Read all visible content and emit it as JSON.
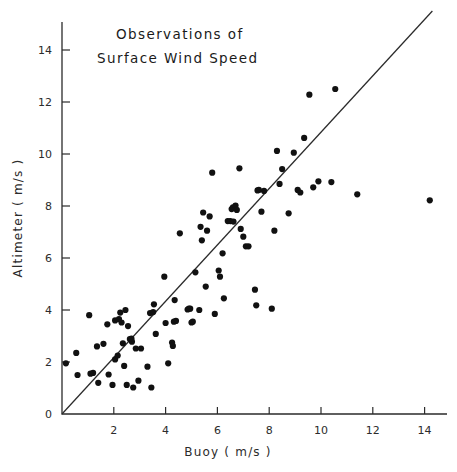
{
  "figure": {
    "title_line1": "Observations of",
    "title_line2": "Surface Wind Speed",
    "background": "#ffffff",
    "ink": "#1a1a1a"
  },
  "chart_data": {
    "type": "scatter",
    "title": "Observations of Surface Wind Speed",
    "xlabel": "Buoy  ( m/s )",
    "ylabel": "Altimeter  ( m/s )",
    "xlim": [
      0,
      15
    ],
    "ylim": [
      0,
      15
    ],
    "grid": false,
    "legend": null,
    "xticks": [
      0,
      2,
      4,
      6,
      8,
      10,
      12,
      14
    ],
    "yticks": [
      0,
      2,
      4,
      6,
      8,
      10,
      12,
      14
    ],
    "xtick_labels": [
      "0",
      "2",
      "4",
      "6",
      "8",
      "10",
      "12",
      "14"
    ],
    "ytick_labels": [
      "0",
      "2",
      "4",
      "6",
      "8",
      "10",
      "12",
      "14"
    ],
    "reference_line": {
      "label": "one-to-one line",
      "x": [
        0.0,
        14.3
      ],
      "y": [
        0.0,
        15.5
      ],
      "slope": 1.085,
      "intercept": 0.0
    },
    "marker": {
      "shape": "circle",
      "size_px": 3.1,
      "color": "#111111"
    },
    "points": [
      {
        "x": 0.15,
        "y": 1.95
      },
      {
        "x": 0.55,
        "y": 2.35
      },
      {
        "x": 0.6,
        "y": 1.5
      },
      {
        "x": 1.05,
        "y": 3.8
      },
      {
        "x": 1.2,
        "y": 1.58
      },
      {
        "x": 1.35,
        "y": 2.6
      },
      {
        "x": 1.4,
        "y": 1.2
      },
      {
        "x": 1.6,
        "y": 2.7
      },
      {
        "x": 1.75,
        "y": 3.45
      },
      {
        "x": 1.8,
        "y": 1.52
      },
      {
        "x": 1.95,
        "y": 1.12
      },
      {
        "x": 2.05,
        "y": 2.1
      },
      {
        "x": 2.15,
        "y": 2.25
      },
      {
        "x": 2.2,
        "y": 3.65
      },
      {
        "x": 2.25,
        "y": 3.9
      },
      {
        "x": 2.3,
        "y": 3.52
      },
      {
        "x": 2.35,
        "y": 2.72
      },
      {
        "x": 2.4,
        "y": 1.85
      },
      {
        "x": 2.45,
        "y": 4.0
      },
      {
        "x": 2.5,
        "y": 1.12
      },
      {
        "x": 2.55,
        "y": 3.38
      },
      {
        "x": 2.62,
        "y": 2.88
      },
      {
        "x": 2.7,
        "y": 2.78
      },
      {
        "x": 2.75,
        "y": 1.02
      },
      {
        "x": 2.85,
        "y": 2.52
      },
      {
        "x": 2.95,
        "y": 1.28
      },
      {
        "x": 3.3,
        "y": 1.82
      },
      {
        "x": 3.4,
        "y": 3.88
      },
      {
        "x": 3.45,
        "y": 1.02
      },
      {
        "x": 3.55,
        "y": 4.22
      },
      {
        "x": 3.62,
        "y": 3.08
      },
      {
        "x": 3.95,
        "y": 5.28
      },
      {
        "x": 4.0,
        "y": 3.5
      },
      {
        "x": 4.1,
        "y": 1.95
      },
      {
        "x": 4.25,
        "y": 2.75
      },
      {
        "x": 4.28,
        "y": 2.62
      },
      {
        "x": 4.32,
        "y": 3.55
      },
      {
        "x": 4.35,
        "y": 4.38
      },
      {
        "x": 4.4,
        "y": 3.58
      },
      {
        "x": 4.55,
        "y": 6.95
      },
      {
        "x": 4.85,
        "y": 4.02
      },
      {
        "x": 4.95,
        "y": 4.05
      },
      {
        "x": 5.0,
        "y": 3.52
      },
      {
        "x": 5.15,
        "y": 5.45
      },
      {
        "x": 5.3,
        "y": 4.0
      },
      {
        "x": 5.35,
        "y": 7.2
      },
      {
        "x": 5.4,
        "y": 6.68
      },
      {
        "x": 5.45,
        "y": 7.75
      },
      {
        "x": 5.55,
        "y": 4.9
      },
      {
        "x": 5.6,
        "y": 7.05
      },
      {
        "x": 5.7,
        "y": 7.6
      },
      {
        "x": 5.8,
        "y": 9.28
      },
      {
        "x": 5.9,
        "y": 3.85
      },
      {
        "x": 6.05,
        "y": 5.52
      },
      {
        "x": 6.1,
        "y": 5.28
      },
      {
        "x": 6.2,
        "y": 6.18
      },
      {
        "x": 6.25,
        "y": 4.45
      },
      {
        "x": 6.4,
        "y": 7.42
      },
      {
        "x": 6.5,
        "y": 7.42
      },
      {
        "x": 6.55,
        "y": 7.88
      },
      {
        "x": 6.6,
        "y": 7.95
      },
      {
        "x": 6.7,
        "y": 8.02
      },
      {
        "x": 6.75,
        "y": 7.85
      },
      {
        "x": 6.85,
        "y": 9.45
      },
      {
        "x": 6.9,
        "y": 7.12
      },
      {
        "x": 7.0,
        "y": 6.82
      },
      {
        "x": 7.1,
        "y": 6.45
      },
      {
        "x": 7.2,
        "y": 6.45
      },
      {
        "x": 7.45,
        "y": 4.78
      },
      {
        "x": 7.5,
        "y": 4.18
      },
      {
        "x": 7.55,
        "y": 8.6
      },
      {
        "x": 7.6,
        "y": 8.62
      },
      {
        "x": 7.7,
        "y": 7.78
      },
      {
        "x": 7.8,
        "y": 8.58
      },
      {
        "x": 8.1,
        "y": 4.05
      },
      {
        "x": 8.2,
        "y": 7.05
      },
      {
        "x": 8.3,
        "y": 10.12
      },
      {
        "x": 8.4,
        "y": 8.85
      },
      {
        "x": 8.5,
        "y": 9.42
      },
      {
        "x": 8.75,
        "y": 7.72
      },
      {
        "x": 8.95,
        "y": 10.05
      },
      {
        "x": 9.1,
        "y": 8.62
      },
      {
        "x": 9.2,
        "y": 8.52
      },
      {
        "x": 9.35,
        "y": 10.62
      },
      {
        "x": 9.55,
        "y": 12.28
      },
      {
        "x": 9.7,
        "y": 8.72
      },
      {
        "x": 9.9,
        "y": 8.95
      },
      {
        "x": 10.4,
        "y": 8.92
      },
      {
        "x": 10.55,
        "y": 12.5
      },
      {
        "x": 11.4,
        "y": 8.45
      },
      {
        "x": 14.2,
        "y": 8.22
      },
      {
        "x": 2.05,
        "y": 3.6
      },
      {
        "x": 3.52,
        "y": 3.92
      },
      {
        "x": 4.9,
        "y": 4.05
      },
      {
        "x": 6.62,
        "y": 7.4
      },
      {
        "x": 2.68,
        "y": 2.9
      },
      {
        "x": 5.05,
        "y": 3.55
      },
      {
        "x": 3.05,
        "y": 2.52
      },
      {
        "x": 1.1,
        "y": 1.55
      }
    ]
  }
}
